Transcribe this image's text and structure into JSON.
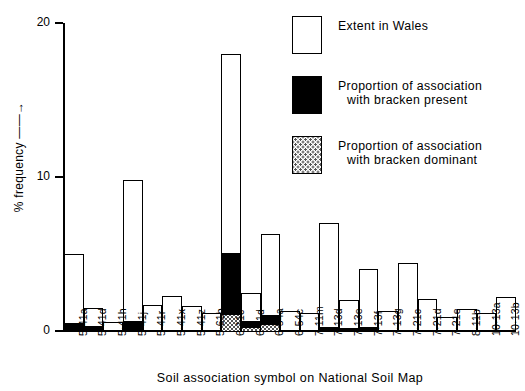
{
  "chart_data": {
    "type": "bar",
    "title": "",
    "xlabel": "Soil association symbol on National Soil Map",
    "ylabel": "% frequency ——→",
    "ylim": [
      0,
      20
    ],
    "yticks": [
      0,
      10,
      20
    ],
    "ytick_labels": [
      "0",
      "10",
      "20"
    ],
    "grid": false,
    "stacked": true,
    "legend_position": "top-right",
    "categories": [
      "5·41a",
      "5·41d",
      "5·41h",
      "5·41j",
      "5·41r",
      "5·41x",
      "5·41z",
      "5·61b",
      "6·11c",
      "6·11d",
      "6·54a",
      "6·54c",
      "7·11m",
      "7·13d",
      "7·13e",
      "7·13f",
      "7·13g",
      "7·21c",
      "7·21d",
      "7·21e",
      "8·11b",
      "10·13a",
      "10·13b"
    ],
    "series": [
      {
        "name": "Extent in Wales",
        "key": "extent",
        "color": "#ffffff",
        "values": [
          5.0,
          1.5,
          0.6,
          9.8,
          1.7,
          2.3,
          1.6,
          1.2,
          18.0,
          2.5,
          6.3,
          1.3,
          1.2,
          7.0,
          2.0,
          4.0,
          1.3,
          4.4,
          2.1,
          0.9,
          1.4,
          1.2,
          2.2
        ]
      },
      {
        "name": "Proportion of association with bracken present",
        "key": "present",
        "color": "#000000",
        "values": [
          0.55,
          0.35,
          0.0,
          0.7,
          0.0,
          0.0,
          0.0,
          0.0,
          4.0,
          0.45,
          0.55,
          0.0,
          0.0,
          0.28,
          0.2,
          0.3,
          0.0,
          0.0,
          0.0,
          0.0,
          0.0,
          0.0,
          0.0
        ]
      },
      {
        "name": "Proportion of association with bracken dominant",
        "key": "dominant",
        "color": "#cccccc",
        "values": [
          0.0,
          0.0,
          0.0,
          0.0,
          0.0,
          0.0,
          0.0,
          0.0,
          1.1,
          0.25,
          0.5,
          0.0,
          0.0,
          0.0,
          0.0,
          0.0,
          0.0,
          0.0,
          0.0,
          0.0,
          0.0,
          0.0,
          0.0
        ]
      }
    ],
    "legend": [
      {
        "label_line1": "Extent in Wales",
        "label_line2": "",
        "swatch": "open"
      },
      {
        "label_line1": "Proportion of association",
        "label_line2": "with bracken present",
        "swatch": "black"
      },
      {
        "label_line1": "Proportion of association",
        "label_line2": "with bracken dominant",
        "swatch": "dotted"
      }
    ]
  }
}
